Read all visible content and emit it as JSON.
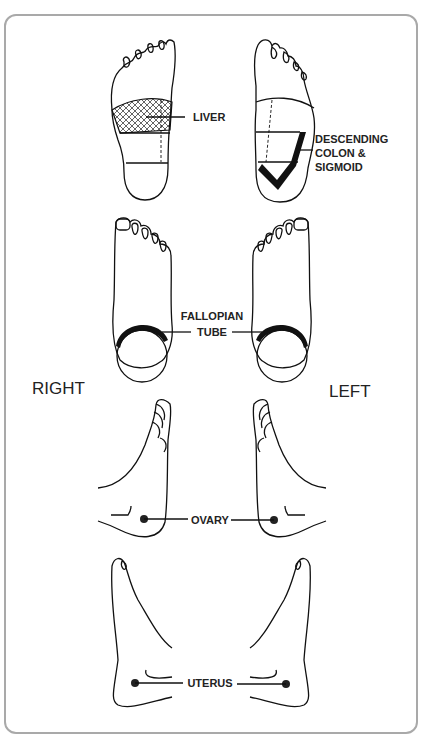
{
  "diagram": {
    "type": "reflexology foot chart",
    "side_labels": {
      "right": "RIGHT",
      "left": "LEFT"
    },
    "labels": {
      "liver": "LIVER",
      "descending_colon_line1": "DESCENDING",
      "descending_colon_line2": "COLON &",
      "descending_colon_line3": "SIGMOID",
      "fallopian_line1": "FALLOPIAN",
      "fallopian_line2": "TUBE",
      "ovary": "OVARY",
      "uterus": "UTERUS"
    },
    "rows": [
      {
        "view": "sole",
        "right_area": "LIVER",
        "left_area": "DESCENDING COLON & SIGMOID"
      },
      {
        "view": "top",
        "area": "FALLOPIAN TUBE"
      },
      {
        "view": "outer side",
        "area": "OVARY"
      },
      {
        "view": "inner side",
        "area": "UTERUS"
      }
    ],
    "colors": {
      "line": "#111111",
      "border": "#a9a9a9",
      "background": "#ffffff"
    }
  }
}
